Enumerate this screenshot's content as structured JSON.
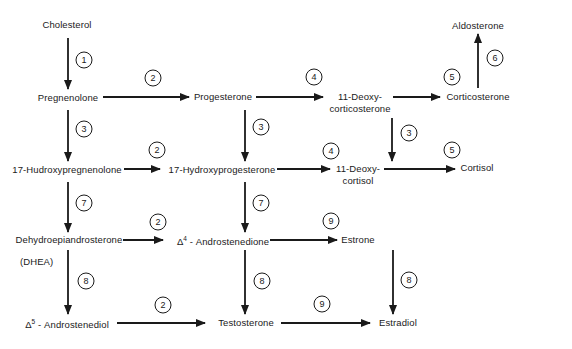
{
  "diagram": {
    "nodes": {
      "cholesterol": "Cholesterol",
      "pregnenolone": "Pregnenolone",
      "progesterone": "Progesterone",
      "deoxycorticosterone_1": "11-Deoxy-",
      "deoxycorticosterone_2": "corticosterone",
      "corticosterone": "Corticosterone",
      "aldosterone": "Aldosterone",
      "hydroxypregnenolone": "17-Hudroxypregnenolone",
      "hydroxyprogesterone": "17-Hydroxyprogesterone",
      "deoxycortisol_1": "11-Deoxy-",
      "deoxycortisol_2": "cortisol",
      "cortisol": "Cortisol",
      "dhea_1": "Dehydroepiandrosterone",
      "dhea_2": "(DHEA)",
      "androstenedione_delta": "Δ",
      "androstenedione_sup": "4",
      "androstenedione_name": " - Androstenedione",
      "estrone": "Estrone",
      "androstenediol_delta": "Δ",
      "androstenediol_sup": "5",
      "androstenediol_name": " - Androstenediol",
      "testosterone": "Testosterone",
      "estradiol": "Estradiol"
    },
    "steps": {
      "s1": "1",
      "s2a": "2",
      "s2b": "2",
      "s2c": "2",
      "s2d": "2",
      "s3a": "3",
      "s3b": "3",
      "s3c": "3",
      "s4a": "4",
      "s4b": "4",
      "s5a": "5",
      "s5b": "5",
      "s6": "6",
      "s7a": "7",
      "s7b": "7",
      "s8a": "8",
      "s8b": "8",
      "s8c": "8",
      "s9a": "9",
      "s9b": "9"
    }
  }
}
